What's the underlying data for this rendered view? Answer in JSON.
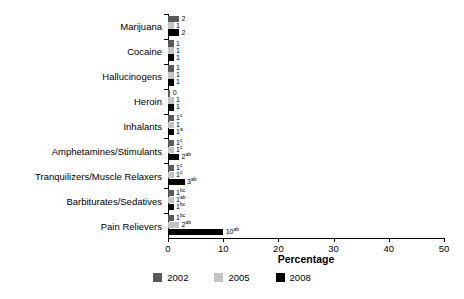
{
  "chart_data": {
    "type": "bar",
    "orientation": "horizontal",
    "title": "",
    "subtitle": "",
    "xlabel": "Percentage",
    "ylabel": "",
    "xlim": [
      0,
      50
    ],
    "xticks": [
      0,
      10,
      20,
      30,
      40,
      50
    ],
    "xtick_labels": [
      "0",
      "10",
      "20",
      "30",
      "40",
      "50"
    ],
    "grid": false,
    "legend_position": "bottom",
    "categories": [
      "Marijuana",
      "Cocaine",
      "Hallucinogens",
      "Heroin",
      "Inhalants",
      "Amphetamines/Stimulants",
      "Tranquilizers/Muscle Relaxers",
      "Barbiturates/Sedatives",
      "Pain Relievers"
    ],
    "series": [
      {
        "name": "2002",
        "color": "#595959",
        "values": [
          2,
          1,
          1,
          0,
          1,
          1,
          1,
          1,
          1
        ],
        "labels": [
          "2",
          "1",
          "1",
          "0",
          "1",
          "1",
          "1",
          "1",
          "1"
        ],
        "superscripts": [
          "",
          "",
          "",
          "",
          "c",
          "c",
          "c",
          "bc",
          "bc"
        ]
      },
      {
        "name": "2005",
        "color": "#c4c4c4",
        "values": [
          1,
          1,
          1,
          1,
          1,
          1,
          1,
          1,
          2
        ],
        "labels": [
          "1",
          "1",
          "1",
          "1",
          "1",
          "1",
          "1",
          "1",
          "2"
        ],
        "superscripts": [
          "",
          "",
          "",
          "",
          "",
          "c",
          "c",
          "ab",
          "ab"
        ]
      },
      {
        "name": "2008",
        "color": "#000000",
        "values": [
          2,
          1,
          1,
          1,
          1,
          2,
          3,
          1,
          10
        ],
        "labels": [
          "2",
          "1",
          "1",
          "1",
          "1",
          "2",
          "3",
          "1",
          "10"
        ],
        "superscripts": [
          "",
          "",
          "",
          "",
          "a",
          "ab",
          "ab",
          "bc",
          "ab"
        ]
      }
    ]
  },
  "legend": {
    "items": [
      {
        "label": "2002",
        "color": "#595959"
      },
      {
        "label": "2005",
        "color": "#c4c4c4"
      },
      {
        "label": "2008",
        "color": "#000000"
      }
    ]
  }
}
